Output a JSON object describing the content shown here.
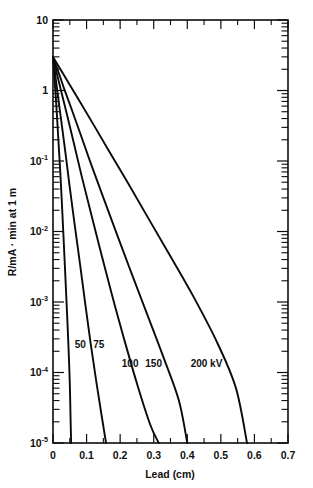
{
  "chart_data": {
    "type": "line",
    "title": "",
    "xlabel": "Lead  (cm)",
    "ylabel": "R/mA · min at 1 m",
    "xlim": [
      0,
      0.7
    ],
    "ylim": [
      1e-05,
      10
    ],
    "yscale": "log",
    "xscale": "linear",
    "grid": false,
    "legend_position": "inline-curve-labels",
    "xticks": [
      0,
      0.1,
      0.2,
      0.3,
      0.4,
      0.5,
      0.6,
      0.7
    ],
    "xticklabels": [
      "0",
      "0.1",
      "0.2",
      "0.3",
      "0.4",
      "0.5",
      "0.6",
      "0.7"
    ],
    "yticks": [
      10,
      1,
      0.1,
      0.01,
      0.001,
      0.0001,
      1e-05
    ],
    "yticklabels": [
      "10",
      "1",
      "10⁻¹",
      "10⁻²",
      "10⁻³",
      "10⁻⁴",
      "10⁻⁵"
    ],
    "ytick_mantissas": [
      "10",
      "1",
      "10",
      "10",
      "10",
      "10",
      "10"
    ],
    "ytick_exponents": [
      "",
      "",
      "-1",
      "-2",
      "-3",
      "-4",
      "-5"
    ],
    "series": [
      {
        "name": "50",
        "label": "50",
        "label_x": 0.065,
        "label_y": 0.00022,
        "points": [
          [
            0.0,
            3.0
          ],
          [
            0.004,
            1.6
          ],
          [
            0.008,
            0.85
          ],
          [
            0.012,
            0.42
          ],
          [
            0.016,
            0.2
          ],
          [
            0.021,
            0.08
          ],
          [
            0.026,
            0.028
          ],
          [
            0.031,
            0.009
          ],
          [
            0.036,
            0.0028
          ],
          [
            0.041,
            0.00085
          ],
          [
            0.046,
            0.00024
          ],
          [
            0.05,
            7e-05
          ],
          [
            0.0525,
            2e-05
          ],
          [
            0.054,
            1e-05
          ]
        ]
      },
      {
        "name": "75",
        "label": "75",
        "label_x": 0.12,
        "label_y": 0.00022,
        "points": [
          [
            0.0,
            3.0
          ],
          [
            0.008,
            1.5
          ],
          [
            0.016,
            0.75
          ],
          [
            0.026,
            0.33
          ],
          [
            0.038,
            0.12
          ],
          [
            0.05,
            0.042
          ],
          [
            0.064,
            0.013
          ],
          [
            0.08,
            0.0036
          ],
          [
            0.096,
            0.00095
          ],
          [
            0.112,
            0.00026
          ],
          [
            0.128,
            8e-05
          ],
          [
            0.144,
            2.6e-05
          ],
          [
            0.158,
            1e-05
          ]
        ]
      },
      {
        "name": "100",
        "label": "100",
        "label_x": 0.205,
        "label_y": 0.00012,
        "points": [
          [
            0.0,
            3.0
          ],
          [
            0.012,
            1.7
          ],
          [
            0.025,
            0.95
          ],
          [
            0.042,
            0.45
          ],
          [
            0.062,
            0.18
          ],
          [
            0.085,
            0.062
          ],
          [
            0.112,
            0.019
          ],
          [
            0.142,
            0.0052
          ],
          [
            0.175,
            0.0013
          ],
          [
            0.21,
            0.00032
          ],
          [
            0.25,
            7e-05
          ],
          [
            0.29,
            1.8e-05
          ],
          [
            0.315,
            1e-05
          ]
        ]
      },
      {
        "name": "150",
        "label": "150",
        "label_x": 0.275,
        "label_y": 0.00012,
        "points": [
          [
            0.0,
            3.0
          ],
          [
            0.015,
            1.9
          ],
          [
            0.032,
            1.1
          ],
          [
            0.055,
            0.55
          ],
          [
            0.082,
            0.24
          ],
          [
            0.112,
            0.094
          ],
          [
            0.148,
            0.032
          ],
          [
            0.188,
            0.0098
          ],
          [
            0.232,
            0.0027
          ],
          [
            0.28,
            0.00068
          ],
          [
            0.33,
            0.00016
          ],
          [
            0.375,
            4e-05
          ],
          [
            0.4,
            1e-05
          ]
        ]
      },
      {
        "name": "200 kV",
        "label": "200 kV",
        "label_x": 0.41,
        "label_y": 0.00012,
        "points": [
          [
            0.0,
            3.0
          ],
          [
            0.022,
            2.0
          ],
          [
            0.048,
            1.25
          ],
          [
            0.082,
            0.67
          ],
          [
            0.122,
            0.32
          ],
          [
            0.168,
            0.135
          ],
          [
            0.222,
            0.05
          ],
          [
            0.282,
            0.016
          ],
          [
            0.348,
            0.0046
          ],
          [
            0.418,
            0.0012
          ],
          [
            0.49,
            0.00026
          ],
          [
            0.545,
            6e-05
          ],
          [
            0.578,
            1e-05
          ]
        ]
      }
    ]
  }
}
